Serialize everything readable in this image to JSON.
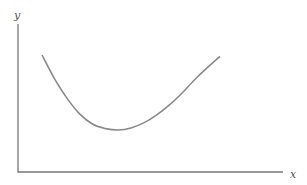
{
  "chart_data": {
    "type": "line",
    "title": "",
    "xlabel": "x",
    "ylabel": "y",
    "grid": false,
    "legend": "none",
    "xlim": [
      0,
      10
    ],
    "ylim": [
      0,
      10
    ],
    "series": [
      {
        "name": "U-shaped curve",
        "x": [
          1,
          1.5,
          2,
          2.5,
          3,
          3.5,
          4,
          4.5,
          5,
          5.5,
          6,
          6.5,
          7,
          7.5,
          8
        ],
        "y": [
          8.1,
          6.4,
          5.0,
          3.9,
          3.2,
          2.9,
          2.8,
          2.95,
          3.3,
          3.85,
          4.55,
          5.4,
          6.35,
          7.2,
          8.0
        ]
      }
    ],
    "colors": {
      "axis": "#777777",
      "curve": "#8a8a8a"
    }
  }
}
